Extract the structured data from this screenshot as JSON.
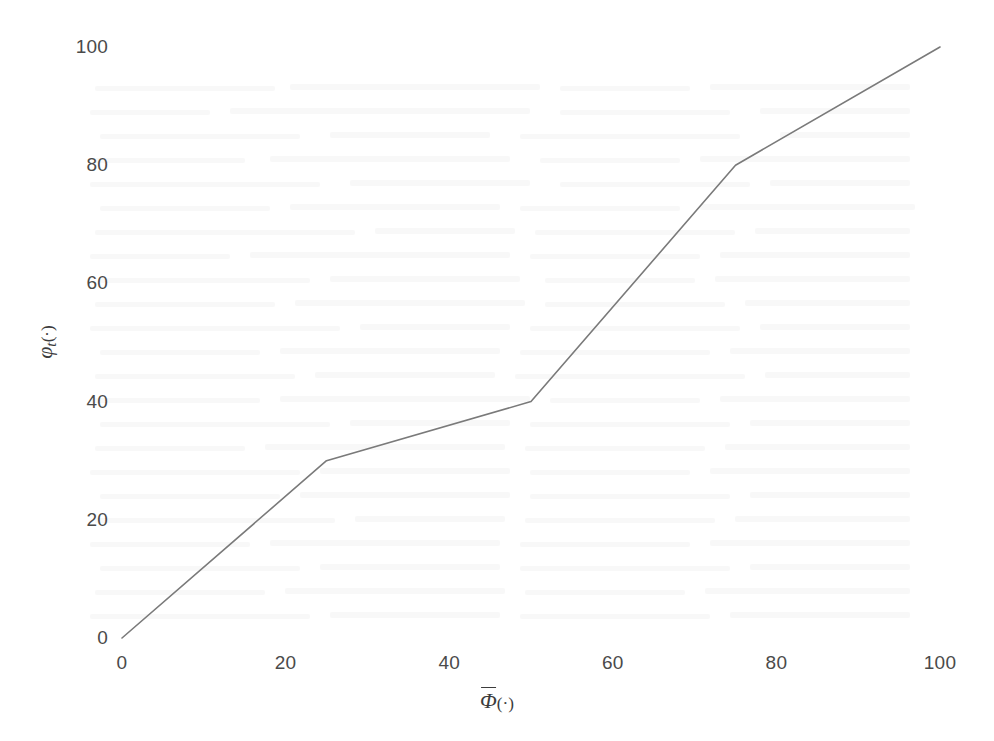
{
  "chart_data": {
    "type": "line",
    "title": "",
    "subtitle": "",
    "xlabel": "Φ̄(·)",
    "ylabel": "φₜ(·)",
    "x": [
      0,
      25,
      50,
      75,
      100
    ],
    "values": [
      0,
      30,
      40,
      80,
      100
    ],
    "series": [
      {
        "name": "phi_t",
        "x": [
          0,
          25,
          50,
          75,
          100
        ],
        "values": [
          0,
          30,
          40,
          80,
          100
        ]
      }
    ],
    "xlim": [
      0,
      100
    ],
    "ylim": [
      0,
      100
    ],
    "xticks": [
      0,
      20,
      40,
      60,
      80,
      100
    ],
    "yticks": [
      0,
      20,
      40,
      60,
      80,
      100
    ],
    "xtick_labels": [
      "0",
      "20",
      "40",
      "60",
      "80",
      "100"
    ],
    "ytick_labels": [
      "0",
      "20",
      "40",
      "60",
      "80",
      "100"
    ],
    "grid": false,
    "legend": false,
    "legend_position": "none",
    "spines": false,
    "tick_marks": false,
    "annotations": [],
    "line_color": "#7a7a7a",
    "line_width": 1.6,
    "background_color": "#ffffff",
    "tick_label_color": "#4a4a4a",
    "axis_title_color": "#3c3c3c"
  },
  "axis_titles": {
    "x_symbol": "Φ",
    "x_suffix": "(·)",
    "y_symbol": "φ",
    "y_subscript": "t",
    "y_suffix": "(·)"
  }
}
